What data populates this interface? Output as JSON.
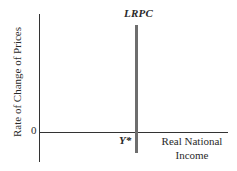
{
  "diagram": {
    "curve_label": "LRPC",
    "origin_label": "0",
    "potential_output_label": "Y*",
    "x_axis_label_line1": "Real National",
    "x_axis_label_line2": "Income",
    "y_axis_label": "Rate of Change of Prices",
    "colors": {
      "axis": "#333333",
      "lrpc_line": "#6e6e6e",
      "text": "#2a2a2a",
      "background": "#ffffff"
    }
  }
}
